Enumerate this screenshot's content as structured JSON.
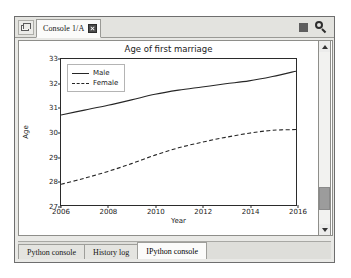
{
  "window": {
    "topbar": {
      "browse_icon": "folder-browse-icon",
      "console_tab_label": "Console 1/A",
      "close_icon": "close-icon",
      "stop_icon": "stop-square-icon",
      "options_icon": "magnifier-options-icon"
    },
    "scrollbar": {
      "up_icon": "chevron-up-icon",
      "down_icon": "chevron-down-icon"
    },
    "bottom_tabs": [
      {
        "label": "Python console",
        "active": false
      },
      {
        "label": "History log",
        "active": false
      },
      {
        "label": "IPython console",
        "active": true
      }
    ]
  },
  "chart_data": {
    "type": "line",
    "title": "Age of first marriage",
    "xlabel": "Year",
    "ylabel": "Age",
    "xlim": [
      2006,
      2016
    ],
    "ylim": [
      27,
      33
    ],
    "xticks": [
      2006,
      2008,
      2010,
      2012,
      2014,
      2016
    ],
    "yticks": [
      27,
      28,
      29,
      30,
      31,
      32,
      33
    ],
    "grid": false,
    "legend_position": "upper left",
    "x": [
      2006,
      2007,
      2008,
      2009,
      2010,
      2011,
      2012,
      2013,
      2014,
      2015,
      2016
    ],
    "series": [
      {
        "name": "Male",
        "style": "solid",
        "color": "#262626",
        "values": [
          30.7,
          30.9,
          31.1,
          31.32,
          31.55,
          31.72,
          31.85,
          31.98,
          32.1,
          32.28,
          32.5
        ]
      },
      {
        "name": "Female",
        "style": "dashed",
        "color": "#262626",
        "values": [
          27.85,
          28.1,
          28.38,
          28.7,
          29.05,
          29.35,
          29.58,
          29.78,
          29.95,
          30.07,
          30.1
        ]
      }
    ]
  }
}
